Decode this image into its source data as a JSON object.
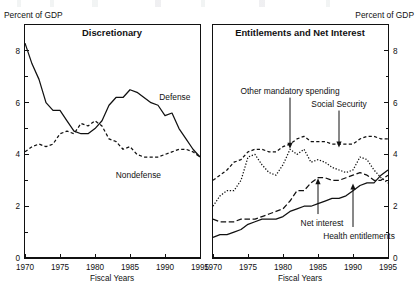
{
  "figure": {
    "width": 418,
    "height": 296,
    "unit_label_left": "Percent of GDP",
    "unit_label_right": "Percent of GDP",
    "xlabel_left": "Fiscal Years",
    "xlabel_right": "Fiscal Years"
  },
  "chart_data": [
    {
      "type": "line",
      "title": "Discretionary",
      "xlabel": "Fiscal Years",
      "ylabel": "Percent of GDP",
      "xlim": [
        1970,
        1995
      ],
      "ylim": [
        0,
        9
      ],
      "xticks": [
        1970,
        1975,
        1980,
        1985,
        1990,
        1995
      ],
      "yticks": [
        0,
        2,
        4,
        6,
        8
      ],
      "grid": false,
      "legend": "inline-annotations",
      "x": [
        1970,
        1971,
        1972,
        1973,
        1974,
        1975,
        1976,
        1977,
        1978,
        1979,
        1980,
        1981,
        1982,
        1983,
        1984,
        1985,
        1986,
        1987,
        1988,
        1989,
        1990,
        1991,
        1992,
        1993,
        1994,
        1995
      ],
      "series": [
        {
          "name": "Defense",
          "style": "solid",
          "label_x": 1991.4,
          "label_y": 6.1,
          "values": [
            8.3,
            7.5,
            6.9,
            6.0,
            5.7,
            5.7,
            5.3,
            4.9,
            4.8,
            4.8,
            5.0,
            5.3,
            5.9,
            6.2,
            6.2,
            6.5,
            6.4,
            6.2,
            6.0,
            5.9,
            5.5,
            5.6,
            5.0,
            4.6,
            4.2,
            3.9
          ]
        },
        {
          "name": "Nondefense",
          "style": "dashed",
          "label_x": 1986.2,
          "label_y": 3.1,
          "values": [
            4.1,
            4.3,
            4.4,
            4.3,
            4.4,
            4.8,
            4.9,
            4.8,
            5.2,
            5.1,
            5.3,
            5.1,
            4.6,
            4.5,
            4.2,
            4.3,
            4.0,
            3.9,
            3.9,
            3.9,
            4.0,
            4.1,
            4.2,
            4.2,
            4.1,
            3.9
          ]
        }
      ]
    },
    {
      "type": "line",
      "title": "Entitlements and Net Interest",
      "xlabel": "Fiscal Years",
      "ylabel": "Percent of GDP",
      "xlim": [
        1970,
        1995
      ],
      "ylim": [
        0,
        9
      ],
      "xticks": [
        1970,
        1975,
        1980,
        1985,
        1990,
        1995
      ],
      "yticks": [
        0,
        2,
        4,
        6,
        8
      ],
      "grid": false,
      "legend": "arrow-annotations",
      "x": [
        1970,
        1971,
        1972,
        1973,
        1974,
        1975,
        1976,
        1977,
        1978,
        1979,
        1980,
        1981,
        1982,
        1983,
        1984,
        1985,
        1986,
        1987,
        1988,
        1989,
        1990,
        1991,
        1992,
        1993,
        1994,
        1995
      ],
      "series": [
        {
          "name": "Social Security",
          "style": "dashed-short",
          "annotation_x": 1988.0,
          "annotation_label_y": 5.85,
          "annotation_point_y": 4.25,
          "values": [
            3.0,
            3.2,
            3.4,
            3.7,
            3.8,
            4.1,
            4.2,
            4.2,
            4.1,
            4.1,
            4.3,
            4.4,
            4.6,
            4.7,
            4.5,
            4.5,
            4.5,
            4.4,
            4.4,
            4.4,
            4.4,
            4.6,
            4.7,
            4.7,
            4.6,
            4.6
          ]
        },
        {
          "name": "Other mandatory spending",
          "style": "dotted",
          "annotation_x": 1981.0,
          "annotation_label_y": 6.35,
          "annotation_point_y": 4.2,
          "values": [
            2.0,
            2.4,
            2.6,
            2.6,
            3.0,
            3.9,
            4.0,
            3.6,
            3.3,
            3.2,
            3.6,
            4.2,
            4.0,
            4.2,
            3.7,
            3.8,
            3.7,
            3.5,
            3.4,
            3.3,
            3.4,
            3.9,
            3.8,
            3.4,
            3.1,
            2.9
          ]
        },
        {
          "name": "Net interest",
          "style": "dashed-long",
          "annotation_x": 1985.0,
          "annotation_label_y": 1.35,
          "annotation_point_y": 3.1,
          "values": [
            1.5,
            1.4,
            1.4,
            1.4,
            1.5,
            1.5,
            1.5,
            1.6,
            1.7,
            1.8,
            1.9,
            2.2,
            2.6,
            2.6,
            2.9,
            3.1,
            3.1,
            3.0,
            3.0,
            3.1,
            3.2,
            3.3,
            3.2,
            3.0,
            3.0,
            3.2
          ]
        },
        {
          "name": "Health entitlements",
          "style": "solid",
          "annotation_x": 1990.0,
          "annotation_label_y": 0.85,
          "annotation_point_y": 2.9,
          "values": [
            0.8,
            0.9,
            0.9,
            1.0,
            1.1,
            1.3,
            1.4,
            1.5,
            1.5,
            1.5,
            1.6,
            1.8,
            1.9,
            2.0,
            2.0,
            2.1,
            2.2,
            2.3,
            2.3,
            2.4,
            2.6,
            2.8,
            2.9,
            2.9,
            3.2,
            3.4
          ]
        }
      ]
    }
  ]
}
